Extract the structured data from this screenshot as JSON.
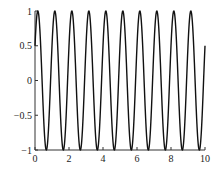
{
  "chart_data": {
    "type": "line",
    "title": "",
    "xlabel": "",
    "ylabel": "",
    "xlim": [
      0,
      10
    ],
    "ylim": [
      -1,
      1
    ],
    "grid": false,
    "legend": null,
    "x_ticks": [
      "0",
      "2",
      "4",
      "6",
      "8",
      "10"
    ],
    "y_ticks": [
      "-1",
      "-0.5",
      "0",
      "0.5",
      "1"
    ],
    "series": [
      {
        "name": "y = cos(2π(x − 1/6))",
        "color": "#111111",
        "function": "cos(2*pi*(x - 0.1667))",
        "x_start": 0,
        "x_end": 10,
        "approx_points": [
          [
            0,
            0.5
          ],
          [
            0.17,
            1
          ],
          [
            0.67,
            -1
          ],
          [
            1.17,
            1
          ],
          [
            1.67,
            -1
          ],
          [
            2.17,
            1
          ],
          [
            2.67,
            -1
          ],
          [
            3.17,
            1
          ],
          [
            3.67,
            -1
          ],
          [
            4.17,
            1
          ],
          [
            4.67,
            -1
          ],
          [
            5.17,
            1
          ],
          [
            5.67,
            -1
          ],
          [
            6.17,
            1
          ],
          [
            6.67,
            -1
          ],
          [
            7.17,
            1
          ],
          [
            7.67,
            -1
          ],
          [
            8.17,
            1
          ],
          [
            8.67,
            -1
          ],
          [
            9.17,
            1
          ],
          [
            9.67,
            -1
          ],
          [
            10,
            0.5
          ]
        ]
      }
    ]
  }
}
